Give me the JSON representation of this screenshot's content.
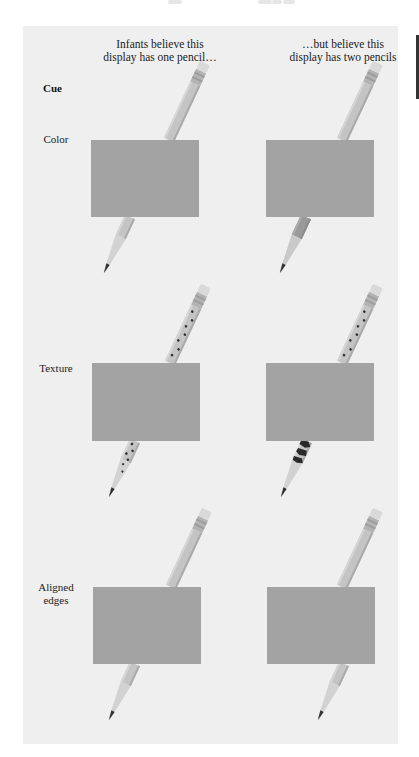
{
  "figure": {
    "column_headers": [
      "Infants believe this\ndisplay has one pencil…",
      "…but believe this\ndisplay has two pencils"
    ],
    "column_header_lines": {
      "left": [
        "Infants believe this",
        "display has one pencil…"
      ],
      "right": [
        "…but believe this",
        "display has two pencils"
      ]
    },
    "cue_header": "Cue",
    "rows": [
      {
        "label": "Color",
        "label_lines": [
          "Color"
        ],
        "left": {
          "upper_pencil": "plain",
          "lower_pencil": "plain",
          "aligned": true,
          "description": "pencil halves same color"
        },
        "right": {
          "upper_pencil": "plain",
          "lower_pencil": "darker color",
          "aligned": true,
          "description": "pencil halves different color"
        }
      },
      {
        "label": "Texture",
        "label_lines": [
          "Texture"
        ],
        "left": {
          "upper_pencil": "small dots",
          "lower_pencil": "small dots",
          "aligned": true,
          "description": "pencil halves same texture"
        },
        "right": {
          "upper_pencil": "small dots",
          "lower_pencil": "large dark blotches",
          "aligned": true,
          "description": "pencil halves different texture"
        }
      },
      {
        "label": "Aligned edges",
        "label_lines": [
          "Aligned",
          "edges"
        ],
        "left": {
          "upper_pencil": "plain",
          "lower_pencil": "plain",
          "aligned": true,
          "description": "pencil edges aligned"
        },
        "right": {
          "upper_pencil": "plain",
          "lower_pencil": "plain",
          "aligned": false,
          "description": "pencil edges misaligned"
        }
      }
    ],
    "colors": {
      "panel_background": "#efefef",
      "occluder": "#a3a3a3",
      "pencil_body": "#c4c4c4",
      "pencil_body_dark": "#9a9a9a",
      "pencil_edge": "#a8a8a8",
      "eraser": "#d9d9d9",
      "ferrule": "#b0b0b0",
      "wood_tip": "#d2d2d2",
      "lead": "#333333",
      "dots": "#2e2e2e"
    }
  }
}
